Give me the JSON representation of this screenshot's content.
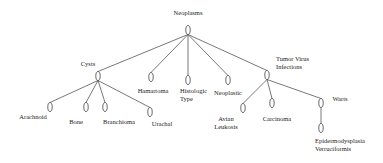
{
  "diagram": {
    "type": "tree",
    "root": "Neoplasms",
    "nodes": [
      {
        "id": "neoplasms",
        "label_lines": [
          "Neoplasms"
        ],
        "x": 188,
        "y": 30,
        "lx": 188,
        "ly": 15,
        "anchor": "middle"
      },
      {
        "id": "cysts",
        "label_lines": [
          "Cysts"
        ],
        "x": 98,
        "y": 76,
        "lx": 88,
        "ly": 66,
        "anchor": "middle"
      },
      {
        "id": "hamartoma",
        "label_lines": [
          "Hamartoma"
        ],
        "x": 151,
        "y": 77,
        "lx": 153,
        "ly": 93,
        "anchor": "middle"
      },
      {
        "id": "histologic-type",
        "label_lines": [
          "Histologic",
          "Type"
        ],
        "x": 188,
        "y": 80,
        "lx": 180,
        "ly": 93,
        "anchor": "start"
      },
      {
        "id": "neoplastic",
        "label_lines": [
          "Neoplastic"
        ],
        "x": 228,
        "y": 80,
        "lx": 228,
        "ly": 95,
        "anchor": "middle"
      },
      {
        "id": "tumor-virus-infections",
        "label_lines": [
          "Tumor Virus",
          "Infections"
        ],
        "x": 267,
        "y": 75,
        "lx": 276,
        "ly": 61,
        "anchor": "start"
      },
      {
        "id": "arachnoid",
        "label_lines": [
          "Arachnoid"
        ],
        "x": 50,
        "y": 107,
        "lx": 33,
        "ly": 119,
        "anchor": "middle"
      },
      {
        "id": "bone",
        "label_lines": [
          "Bone"
        ],
        "x": 86,
        "y": 107,
        "lx": 76,
        "ly": 124,
        "anchor": "middle"
      },
      {
        "id": "branchioma",
        "label_lines": [
          "Branchioma"
        ],
        "x": 105,
        "y": 107,
        "lx": 119,
        "ly": 124,
        "anchor": "middle"
      },
      {
        "id": "urachal",
        "label_lines": [
          "Urachal"
        ],
        "x": 150,
        "y": 112,
        "lx": 162,
        "ly": 126,
        "anchor": "middle"
      },
      {
        "id": "avian-leukosis",
        "label_lines": [
          "Avian",
          "Leukosis"
        ],
        "x": 243,
        "y": 108,
        "lx": 226,
        "ly": 121,
        "anchor": "middle"
      },
      {
        "id": "carcinoma",
        "label_lines": [
          "Carcinoma"
        ],
        "x": 272,
        "y": 103,
        "lx": 277,
        "ly": 121,
        "anchor": "middle"
      },
      {
        "id": "warts",
        "label_lines": [
          "Warts"
        ],
        "x": 321,
        "y": 103,
        "lx": 340,
        "ly": 101,
        "anchor": "middle"
      },
      {
        "id": "epidermodysplasia-verruciformis",
        "label_lines": [
          "Epidermodysplasia",
          "Verruciformis"
        ],
        "x": 321,
        "y": 128,
        "lx": 315,
        "ly": 143,
        "anchor": "start"
      }
    ],
    "edges": [
      [
        "neoplasms",
        "cysts"
      ],
      [
        "neoplasms",
        "hamartoma"
      ],
      [
        "neoplasms",
        "histologic-type"
      ],
      [
        "neoplasms",
        "neoplastic"
      ],
      [
        "neoplasms",
        "tumor-virus-infections"
      ],
      [
        "cysts",
        "arachnoid"
      ],
      [
        "cysts",
        "bone"
      ],
      [
        "cysts",
        "branchioma"
      ],
      [
        "cysts",
        "urachal"
      ],
      [
        "tumor-virus-infections",
        "avian-leukosis"
      ],
      [
        "tumor-virus-infections",
        "carcinoma"
      ],
      [
        "tumor-virus-infections",
        "warts"
      ],
      [
        "warts",
        "epidermodysplasia-verruciformis"
      ]
    ]
  }
}
